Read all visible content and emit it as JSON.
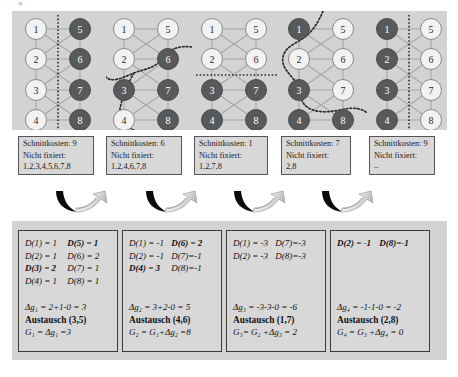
{
  "figure": {
    "faint_header": "· ·   ■· ·",
    "panel_bg": "#d3d3d3",
    "box_bg": "#d8d8d8",
    "node_dark": "#58595b",
    "node_light": "#f2f2f2",
    "edge_color": "#a8a8a8",
    "cut_color": "#2b2b2b"
  },
  "graphs": [
    {
      "name": "graph-step-0",
      "nodes": [
        {
          "id": "1",
          "shade": "light",
          "x": 18,
          "y": 18
        },
        {
          "id": "2",
          "shade": "light",
          "x": 18,
          "y": 48
        },
        {
          "id": "3",
          "shade": "light",
          "x": 18,
          "y": 79
        },
        {
          "id": "4",
          "shade": "light",
          "x": 18,
          "y": 109
        },
        {
          "id": "5",
          "shade": "dark",
          "x": 62,
          "y": 18
        },
        {
          "id": "6",
          "shade": "dark",
          "x": 62,
          "y": 48
        },
        {
          "id": "7",
          "shade": "dark",
          "x": 62,
          "y": 79
        },
        {
          "id": "8",
          "shade": "dark",
          "x": 62,
          "y": 109
        }
      ],
      "cut_type": "vertical-dotted",
      "cut_x": 40
    },
    {
      "name": "graph-step-1",
      "nodes": [
        {
          "id": "1",
          "shade": "light",
          "x": 18,
          "y": 18
        },
        {
          "id": "2",
          "shade": "light",
          "x": 18,
          "y": 48
        },
        {
          "id": "3",
          "shade": "dark",
          "x": 18,
          "y": 79
        },
        {
          "id": "4",
          "shade": "light",
          "x": 18,
          "y": 109
        },
        {
          "id": "5",
          "shade": "light",
          "x": 62,
          "y": 18
        },
        {
          "id": "6",
          "shade": "dark",
          "x": 62,
          "y": 48
        },
        {
          "id": "7",
          "shade": "dark",
          "x": 62,
          "y": 79
        },
        {
          "id": "8",
          "shade": "dark",
          "x": 62,
          "y": 109
        }
      ],
      "cut_type": "wavy",
      "cut_path": "M 86 36 C 70 34 62 40 56 48 C 48 58 38 58 28 62 C 16 67 6 72 0 66 M 28 62 C 22 72 16 86 14 98 C 13 108 22 118 34 122"
    },
    {
      "name": "graph-step-2",
      "nodes": [
        {
          "id": "1",
          "shade": "light",
          "x": 18,
          "y": 18
        },
        {
          "id": "2",
          "shade": "light",
          "x": 18,
          "y": 48
        },
        {
          "id": "3",
          "shade": "dark",
          "x": 18,
          "y": 79
        },
        {
          "id": "4",
          "shade": "dark",
          "x": 18,
          "y": 109
        },
        {
          "id": "5",
          "shade": "light",
          "x": 62,
          "y": 18
        },
        {
          "id": "6",
          "shade": "light",
          "x": 62,
          "y": 48
        },
        {
          "id": "7",
          "shade": "dark",
          "x": 62,
          "y": 79
        },
        {
          "id": "8",
          "shade": "dark",
          "x": 62,
          "y": 109
        }
      ],
      "cut_type": "horizontal-dotted",
      "cut_y": 64
    },
    {
      "name": "graph-step-3",
      "nodes": [
        {
          "id": "1",
          "shade": "dark",
          "x": 18,
          "y": 18
        },
        {
          "id": "2",
          "shade": "light",
          "x": 18,
          "y": 48
        },
        {
          "id": "3",
          "shade": "dark",
          "x": 18,
          "y": 79
        },
        {
          "id": "4",
          "shade": "dark",
          "x": 18,
          "y": 109
        },
        {
          "id": "5",
          "shade": "light",
          "x": 62,
          "y": 18
        },
        {
          "id": "6",
          "shade": "light",
          "x": 62,
          "y": 48
        },
        {
          "id": "7",
          "shade": "light",
          "x": 62,
          "y": 79
        },
        {
          "id": "8",
          "shade": "dark",
          "x": 62,
          "y": 109
        }
      ],
      "cut_type": "wavy",
      "cut_path": "M 42 0 C 38 10 32 20 24 26 C 14 33 4 36 2 46 C 0 56 8 62 14 70 C 20 80 18 90 26 96 C 38 104 54 100 64 98 C 74 96 82 98 86 102"
    },
    {
      "name": "graph-step-4",
      "nodes": [
        {
          "id": "1",
          "shade": "dark",
          "x": 18,
          "y": 18
        },
        {
          "id": "2",
          "shade": "dark",
          "x": 18,
          "y": 48
        },
        {
          "id": "3",
          "shade": "dark",
          "x": 18,
          "y": 79
        },
        {
          "id": "4",
          "shade": "dark",
          "x": 18,
          "y": 109
        },
        {
          "id": "5",
          "shade": "light",
          "x": 62,
          "y": 18
        },
        {
          "id": "6",
          "shade": "light",
          "x": 62,
          "y": 48
        },
        {
          "id": "7",
          "shade": "light",
          "x": 62,
          "y": 79
        },
        {
          "id": "8",
          "shade": "light",
          "x": 62,
          "y": 109
        }
      ],
      "cut_type": "vertical-dotted",
      "cut_x": 40
    }
  ],
  "info_boxes": [
    {
      "name": "info-box-0",
      "cost_label": "Schnittkosten: 9",
      "fixed_label": "Nicht fixiert:",
      "fixed_values": "1,2,3,4,5,6,7,8"
    },
    {
      "name": "info-box-1",
      "cost_label": "Schnittkosten: 6",
      "fixed_label": "Nicht fixiert:",
      "fixed_values": "1,2,4,6,7,8"
    },
    {
      "name": "info-box-2",
      "cost_label": "Schnittkosten: 1",
      "fixed_label": "Nicht fixiert:",
      "fixed_values": "1,2,7,8"
    },
    {
      "name": "info-box-3",
      "cost_label": "Schnittkosten: 7",
      "fixed_label": "Nicht fixiert:",
      "fixed_values": "2,8"
    },
    {
      "name": "info-box-4",
      "cost_label": "Schnittkosten: 9",
      "fixed_label": "Nicht fixiert:",
      "fixed_values": "–"
    }
  ],
  "arrows": [
    {
      "name": "arrow-icon-1"
    },
    {
      "name": "arrow-icon-2"
    },
    {
      "name": "arrow-icon-3"
    },
    {
      "name": "arrow-icon-4"
    }
  ],
  "steps": [
    {
      "name": "step-box-1",
      "d_rows": [
        {
          "left": "D(1) = 1",
          "left_bold": false,
          "right": "D(5) = 1",
          "right_bold": true
        },
        {
          "left": "D(2) = 1",
          "left_bold": false,
          "right": "D(6) = 2",
          "right_bold": false
        },
        {
          "left": "D(3) = 2",
          "left_bold": true,
          "right": "D(7) = 1",
          "right_bold": false
        },
        {
          "left": "D(4) = 1",
          "left_bold": false,
          "right": "D(8) = 1",
          "right_bold": false
        }
      ],
      "delta": "Δg₁ = 2+1-0 = 3",
      "swap": "Austausch (3,5)",
      "gain": "G₁ = Δg₁ =3"
    },
    {
      "name": "step-box-2",
      "d_rows": [
        {
          "left": "D(1) = -1",
          "left_bold": false,
          "right": "D(6) = 2",
          "right_bold": true
        },
        {
          "left": "D(2) = -1",
          "left_bold": false,
          "right": "D(7)=-1",
          "right_bold": false
        },
        {
          "left": "D(4) = 3",
          "left_bold": true,
          "right": "D(8)=-1",
          "right_bold": false
        }
      ],
      "delta": "Δg₂ = 3+2-0 = 5",
      "swap": "Austausch (4,6)",
      "gain": "G₂ = G₁+Δg₂ =8"
    },
    {
      "name": "step-box-3",
      "d_rows": [
        {
          "left": "D(1) = -3",
          "left_bold": false,
          "right": "D(7)=-3",
          "right_bold": false
        },
        {
          "left": "D(2) = -3",
          "left_bold": false,
          "right": "D(8)=-3",
          "right_bold": false
        }
      ],
      "delta": "Δg₃ = -3-3-0 = -6",
      "swap": "Austausch (1,7)",
      "gain": "G₃= G₂ +Δg₃ = 2"
    },
    {
      "name": "step-box-4",
      "d_rows": [
        {
          "left": "D(2) = -1",
          "left_bold": true,
          "right": "D(8)=-1",
          "right_bold": true
        }
      ],
      "delta": "Δg₄ = -1-1-0 = -2",
      "swap": "Austausch (2,8)",
      "gain": "G₄ = G₃ +Δg₄ = 0"
    }
  ]
}
